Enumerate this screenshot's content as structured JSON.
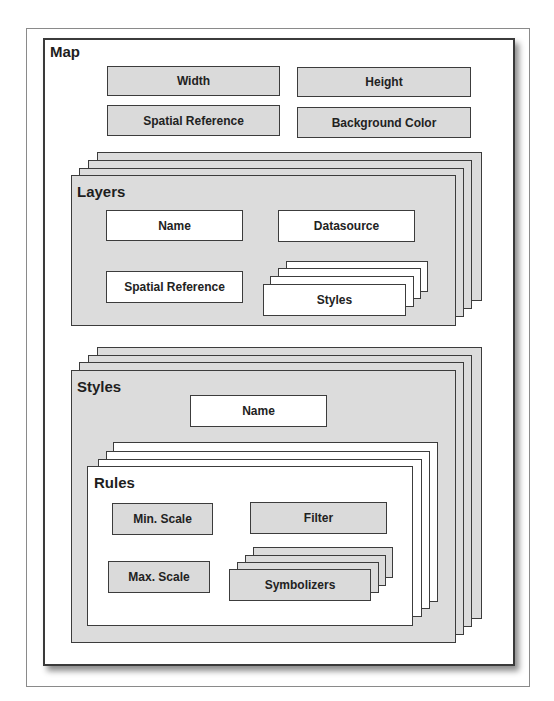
{
  "diagram": {
    "map": {
      "title": "Map",
      "properties": [
        "Width",
        "Height",
        "Spatial Reference",
        "Background Color"
      ]
    },
    "layers": {
      "title": "Layers",
      "properties": [
        "Name",
        "Datasource",
        "Spatial Reference"
      ],
      "nested_stack_label": "Styles"
    },
    "styles": {
      "title": "Styles",
      "properties": [
        "Name"
      ]
    },
    "rules": {
      "title": "Rules",
      "properties": [
        "Min. Scale",
        "Filter",
        "Max. Scale"
      ],
      "nested_stack_label": "Symbolizers"
    }
  },
  "colors": {
    "box_gray": "#dcdcdc",
    "box_white": "#ffffff",
    "border": "#3c3c3c"
  }
}
